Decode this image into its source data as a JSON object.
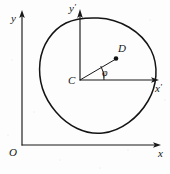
{
  "figure": {
    "kind": "geometry-diagram",
    "background_color": "#fdfdfd",
    "ink_color": "#141414"
  },
  "global_frame": {
    "origin_label": "O",
    "x_axis_label": "x",
    "y_axis_label": "y",
    "origin_px": [
      22,
      145
    ],
    "x_axis_end_px": [
      160,
      145
    ],
    "y_axis_end_px": [
      22,
      12
    ]
  },
  "body_frame": {
    "origin_label": "C",
    "x_axis_label": "x",
    "x_axis_prime": "′",
    "y_axis_label": "y",
    "y_axis_prime": "′",
    "origin_px": [
      80,
      80
    ],
    "x_axis_end_px": [
      160,
      80
    ],
    "y_axis_end_px": [
      80,
      12
    ]
  },
  "points": [
    {
      "label": "C",
      "px": [
        80,
        80
      ],
      "marked": false
    },
    {
      "label": "D",
      "px": [
        116,
        59
      ],
      "marked": true
    }
  ],
  "segments": [
    {
      "from": "C",
      "to": "D"
    }
  ],
  "angle": {
    "symbol": "φ",
    "name": "phi",
    "from_axis": "x",
    "to_segment": "CD",
    "vertex": "C",
    "arc_radius_px": 24
  },
  "body_outline": {
    "type": "closed-smooth-curve",
    "shape": "tilted oval / egg-shaped lamina",
    "bbox_px": [
      40,
      18,
      156,
      134
    ]
  }
}
